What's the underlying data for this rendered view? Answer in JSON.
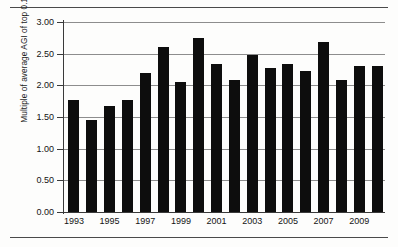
{
  "chart_data": {
    "type": "bar",
    "title": "",
    "subtitle": "",
    "xlabel": "",
    "ylabel": "Multiple of average AGI of top 0.1%",
    "categories": [
      1993,
      1994,
      1995,
      1996,
      1997,
      1998,
      1999,
      2000,
      2001,
      2002,
      2003,
      2004,
      2005,
      2006,
      2007,
      2008,
      2009,
      2010
    ],
    "values": [
      1.77,
      1.45,
      1.68,
      1.77,
      2.2,
      2.61,
      2.05,
      2.74,
      2.33,
      2.09,
      2.48,
      2.28,
      2.33,
      2.22,
      2.68,
      2.09,
      2.3,
      2.3
    ],
    "series": [
      {
        "name": "Multiple of average AGI of top 0.1%",
        "values": [
          1.77,
          1.45,
          1.68,
          1.77,
          2.2,
          2.61,
          2.05,
          2.74,
          2.33,
          2.09,
          2.48,
          2.28,
          2.33,
          2.22,
          2.68,
          2.09,
          2.3,
          2.3
        ]
      }
    ],
    "ylim": [
      0.0,
      3.0
    ],
    "ytick_values": [
      0.0,
      0.5,
      1.0,
      1.5,
      2.0,
      2.5,
      3.0
    ],
    "ytick_labels": [
      "0.00",
      "0.50",
      "1.00",
      "1.50",
      "2.00",
      "2.50",
      "3.00"
    ],
    "xtick_labels": [
      "1993",
      "1995",
      "1997",
      "1999",
      "2001",
      "2003",
      "2005",
      "2007",
      "2009"
    ],
    "xtick_categories": [
      1993,
      1995,
      1997,
      1999,
      2001,
      2003,
      2005,
      2007,
      2009
    ],
    "grid": "horizontal",
    "legend": "none",
    "bar_color": "#0d0d0d",
    "gridline_color": "#8d8d8d",
    "axis_color": "#3a3a3a",
    "background_color": "#fdfdfc",
    "annotations": []
  },
  "figure": {
    "top_rule": "",
    "bottom_rule": ""
  }
}
